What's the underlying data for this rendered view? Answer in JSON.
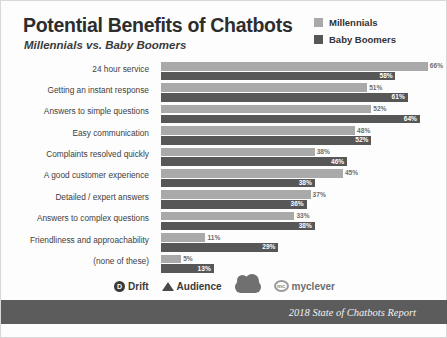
{
  "header": {
    "title": "Potential Benefits of Chatbots",
    "subtitle": "Millennials vs. Baby Boomers"
  },
  "legend": {
    "items": [
      {
        "label": "Millennials",
        "color": "#a9a9a9"
      },
      {
        "label": "Baby Boomers",
        "color": "#575757"
      }
    ]
  },
  "footer": {
    "attribution": "2018 State of Chatbots Report",
    "logos": [
      {
        "name": "drift-logo",
        "mark": "drift-mark-icon",
        "text": "Drift"
      },
      {
        "name": "audience-logo",
        "mark": "audience-mark-icon",
        "text": "Audience"
      },
      {
        "name": "salesforce-logo",
        "mark": "salesforce-cloud-icon",
        "text": ""
      },
      {
        "name": "myclever-logo",
        "mark": "myclever-mark-icon",
        "text": "myclever"
      }
    ]
  },
  "chart_data": {
    "type": "bar",
    "orientation": "horizontal",
    "title": "Potential Benefits of Chatbots",
    "subtitle": "Millennials vs. Baby Boomers",
    "xlabel": "",
    "ylabel": "",
    "xlim": [
      0,
      70
    ],
    "grid": false,
    "legend_position": "top-right",
    "value_suffix": "%",
    "categories": [
      "24 hour service",
      "Getting an instant response",
      "Answers to simple questions",
      "Easy communication",
      "Complaints resolved quickly",
      "A good customer experience",
      "Detailed / expert answers",
      "Answers to complex questions",
      "Friendliness and approachability",
      "(none of these)"
    ],
    "series": [
      {
        "name": "Millennials",
        "color": "#a9a9a9",
        "values": [
          66,
          51,
          52,
          48,
          38,
          45,
          37,
          33,
          11,
          5
        ],
        "labels": [
          "66%",
          "51%",
          "52%",
          "48%",
          "38%",
          "45%",
          "37%",
          "33%",
          "11%",
          "5%"
        ]
      },
      {
        "name": "Baby Boomers",
        "color": "#575757",
        "values": [
          58,
          61,
          64,
          52,
          46,
          38,
          36,
          38,
          29,
          13
        ],
        "labels": [
          "58%",
          "61%",
          "64%",
          "52%",
          "46%",
          "38%",
          "36%",
          "38%",
          "29%",
          "13%"
        ]
      }
    ]
  }
}
